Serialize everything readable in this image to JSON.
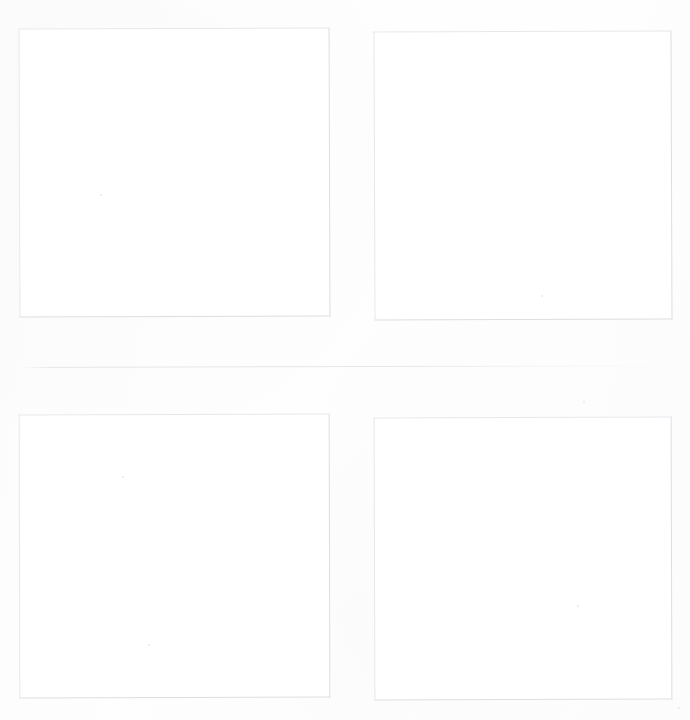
{
  "page": {
    "width_px": 690,
    "height_px": 720,
    "background_color": "#fefefe",
    "content_text": "",
    "notes_visible_on_page": "none"
  },
  "colors": {
    "page_background": "#fefefe",
    "panel_fill": "#ffffff",
    "panel_border": "#dcdee2",
    "panel_border_light": "#e6e8ec",
    "divider_line": "#e0e2e6",
    "speck": "#e9eaec"
  },
  "divider": {
    "name": "row-divider",
    "x": 20,
    "y": 367,
    "width": 665,
    "thickness_px": 1,
    "color": "#e0e2e6"
  },
  "panels": [
    {
      "id": "panel-1",
      "position_label": "top-left",
      "x": 19,
      "y": 28,
      "width": 311,
      "height": 289,
      "border_color": "#dcdee2",
      "fill": "#ffffff",
      "content": ""
    },
    {
      "id": "panel-2",
      "position_label": "top-right",
      "x": 374,
      "y": 31,
      "width": 298,
      "height": 289,
      "border_color": "#dcdee2",
      "fill": "#ffffff",
      "content": ""
    },
    {
      "id": "panel-3",
      "position_label": "bottom-left",
      "x": 19,
      "y": 414,
      "width": 311,
      "height": 284,
      "border_color": "#dcdee2",
      "fill": "#ffffff",
      "content": ""
    },
    {
      "id": "panel-4",
      "position_label": "bottom-right",
      "x": 374,
      "y": 417,
      "width": 298,
      "height": 283,
      "border_color": "#dcdee2",
      "fill": "#ffffff",
      "content": ""
    }
  ],
  "specks": [
    {
      "x": 100,
      "y": 194,
      "size": 2
    },
    {
      "x": 541,
      "y": 295,
      "size": 2
    },
    {
      "x": 122,
      "y": 476,
      "size": 2
    },
    {
      "x": 583,
      "y": 401,
      "size": 2
    },
    {
      "x": 148,
      "y": 644,
      "size": 2
    },
    {
      "x": 577,
      "y": 605,
      "size": 2
    },
    {
      "x": 678,
      "y": 707,
      "size": 2
    }
  ]
}
